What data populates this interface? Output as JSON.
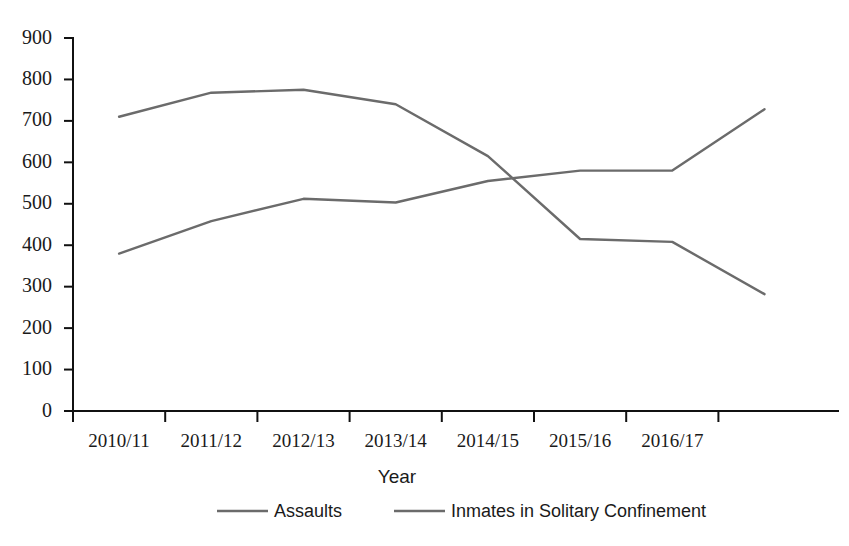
{
  "chart_data": {
    "type": "line",
    "title": "",
    "subtitle": "",
    "xlabel": "Year",
    "ylabel": "",
    "categories": [
      "2010/11",
      "2011/12",
      "2012/13",
      "2013/14",
      "2014/15",
      "2015/16",
      "2016/17",
      ""
    ],
    "xtick_labels": [
      "2010/11",
      "2011/12",
      "2012/13",
      "2013/14",
      "2014/15",
      "2015/16",
      "2016/17"
    ],
    "ytick_labels": [
      "0",
      "100",
      "200",
      "300",
      "400",
      "500",
      "600",
      "700",
      "800",
      "900"
    ],
    "ylim": [
      0,
      900
    ],
    "ytick_step": 100,
    "grid": false,
    "legend_position": "bottom",
    "series": [
      {
        "name": "Assaults",
        "color": "#6b6b6b",
        "values": [
          710,
          768,
          775,
          740,
          615,
          415,
          408,
          282
        ]
      },
      {
        "name": "Inmates in Solitary Confinement",
        "color": "#6b6b6b",
        "values": [
          380,
          458,
          512,
          503,
          555,
          580,
          580,
          728
        ]
      }
    ]
  },
  "axes": {
    "x_title": "Year",
    "y_title": ""
  },
  "legend": {
    "items": [
      {
        "label": "Assaults",
        "color": "#6b6b6b"
      },
      {
        "label": "Inmates in Solitary Confinement",
        "color": "#6b6b6b"
      }
    ]
  },
  "colors": {
    "assaults_line": "#6b6b6b",
    "solitary_line": "#6b6b6b",
    "axis": "#111111",
    "text": "#1a1a1a",
    "background": "#ffffff"
  }
}
